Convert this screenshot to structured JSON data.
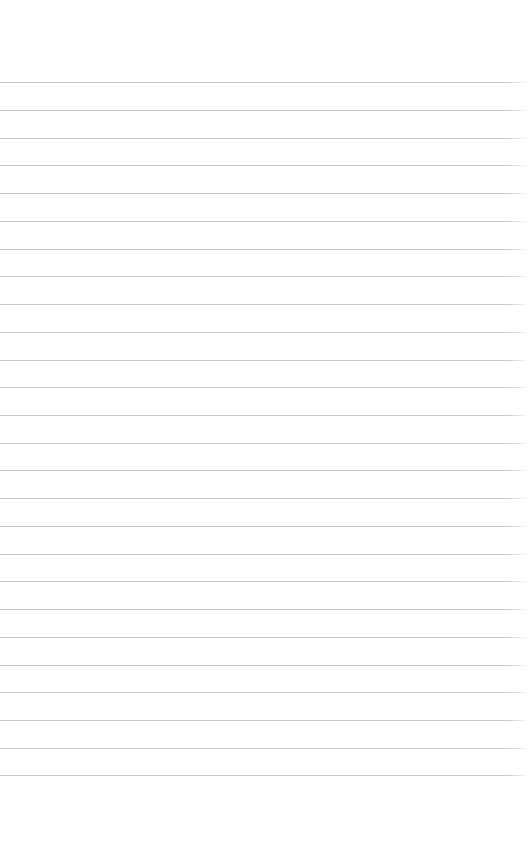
{
  "page": {
    "width": 528,
    "height": 862,
    "background_color": "#ffffff",
    "kind": "blank-lined-paper",
    "content_text": ""
  },
  "ruling": {
    "line_color": "#c9c9cd",
    "line_thickness_px": 1,
    "line_count": 26,
    "first_line_y": 82,
    "line_spacing_px": 27.72,
    "last_line_y": 775,
    "line_left_x": 0,
    "line_right_x": 528,
    "top_margin_px": 82,
    "bottom_margin_px": 87
  },
  "lines": [
    {
      "index": 1,
      "y": 82,
      "text": ""
    },
    {
      "index": 2,
      "y": 110,
      "text": ""
    },
    {
      "index": 3,
      "y": 138,
      "text": ""
    },
    {
      "index": 4,
      "y": 165,
      "text": ""
    },
    {
      "index": 5,
      "y": 193,
      "text": ""
    },
    {
      "index": 6,
      "y": 221,
      "text": ""
    },
    {
      "index": 7,
      "y": 249,
      "text": ""
    },
    {
      "index": 8,
      "y": 276,
      "text": ""
    },
    {
      "index": 9,
      "y": 304,
      "text": ""
    },
    {
      "index": 10,
      "y": 332,
      "text": ""
    },
    {
      "index": 11,
      "y": 360,
      "text": ""
    },
    {
      "index": 12,
      "y": 387,
      "text": ""
    },
    {
      "index": 13,
      "y": 415,
      "text": ""
    },
    {
      "index": 14,
      "y": 443,
      "text": ""
    },
    {
      "index": 15,
      "y": 470,
      "text": ""
    },
    {
      "index": 16,
      "y": 498,
      "text": ""
    },
    {
      "index": 17,
      "y": 526,
      "text": ""
    },
    {
      "index": 18,
      "y": 554,
      "text": ""
    },
    {
      "index": 19,
      "y": 581,
      "text": ""
    },
    {
      "index": 20,
      "y": 609,
      "text": ""
    },
    {
      "index": 21,
      "y": 637,
      "text": ""
    },
    {
      "index": 22,
      "y": 665,
      "text": ""
    },
    {
      "index": 23,
      "y": 692,
      "text": ""
    },
    {
      "index": 24,
      "y": 720,
      "text": ""
    },
    {
      "index": 25,
      "y": 748,
      "text": ""
    },
    {
      "index": 26,
      "y": 775,
      "text": ""
    }
  ]
}
